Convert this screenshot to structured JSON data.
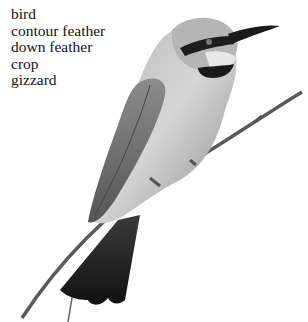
{
  "vocabulary": {
    "words": [
      "bird",
      "bird",
      "contour feather",
      "down feather",
      "crop",
      "gizzard"
    ]
  },
  "image": {
    "subject": "bee-eater bird perched on branch",
    "colors": {
      "background": "#ffffff",
      "text": "#111111"
    }
  }
}
